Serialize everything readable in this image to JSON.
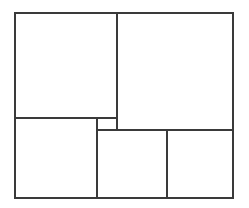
{
  "figure": {
    "title": "Squared rectangle dissection",
    "caption": "",
    "background_color": "#ffffff",
    "line_color": "#3a3a3a",
    "fill_color": "#ffffff",
    "canvas": {
      "width": 249,
      "height": 208
    }
  },
  "outer": {
    "label": "outer-rectangle",
    "x": 15,
    "y": 13,
    "width": 218,
    "height": 185
  },
  "regions": [
    {
      "name": "top-left-square",
      "label": "",
      "x": 15,
      "y": 13,
      "width": 102,
      "height": 105
    },
    {
      "name": "top-right-square",
      "label": "",
      "x": 117,
      "y": 13,
      "width": 116,
      "height": 117
    },
    {
      "name": "bottom-left-square",
      "label": "",
      "x": 15,
      "y": 118,
      "width": 82,
      "height": 80
    },
    {
      "name": "small-center-square",
      "label": "",
      "x": 97,
      "y": 118,
      "width": 20,
      "height": 12
    },
    {
      "name": "bottom-middle-square",
      "label": "",
      "x": 97,
      "y": 130,
      "width": 70,
      "height": 68
    },
    {
      "name": "bottom-right-square",
      "label": "",
      "x": 167,
      "y": 130,
      "width": 66,
      "height": 68
    }
  ]
}
